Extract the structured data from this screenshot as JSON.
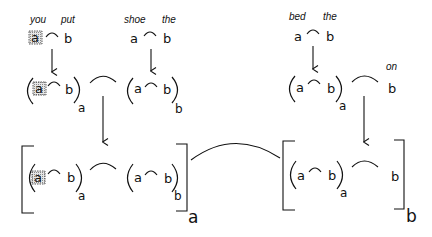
{
  "diagram": {
    "top_row": {
      "left": {
        "words": [
          "you",
          "put"
        ],
        "symbols": [
          "a",
          "b"
        ],
        "a_highlighted": true
      },
      "middle": {
        "words": [
          "shoe",
          "the"
        ],
        "symbols": [
          "a",
          "b"
        ]
      },
      "right": {
        "words": [
          "bed",
          "the"
        ],
        "symbols": [
          "a",
          "b"
        ]
      }
    },
    "middle_row": {
      "left": {
        "symbols": [
          "a",
          "b"
        ],
        "subscript": "a",
        "a_highlighted": true
      },
      "middle": {
        "symbols": [
          "a",
          "b"
        ],
        "subscript": "b"
      },
      "right": {
        "symbols": [
          "a",
          "b"
        ],
        "subscript": "a"
      },
      "on_word": "on",
      "on_symbol": "b"
    },
    "bottom_row": {
      "left_bracket": {
        "inner_left": {
          "symbols": [
            "a",
            "b"
          ],
          "subscript": "a",
          "a_highlighted": true
        },
        "inner_right": {
          "symbols": [
            "a",
            "b"
          ],
          "subscript": "b"
        },
        "subscript": "a"
      },
      "right_bracket": {
        "inner_left": {
          "symbols": [
            "a",
            "b"
          ],
          "subscript": "a"
        },
        "inner_right_symbol": "b",
        "subscript": "b"
      }
    },
    "connector": "concatenation arc",
    "colors": {
      "ink": "#111111",
      "background": "#ffffff",
      "highlight_shade": "#9a9a9a"
    }
  }
}
